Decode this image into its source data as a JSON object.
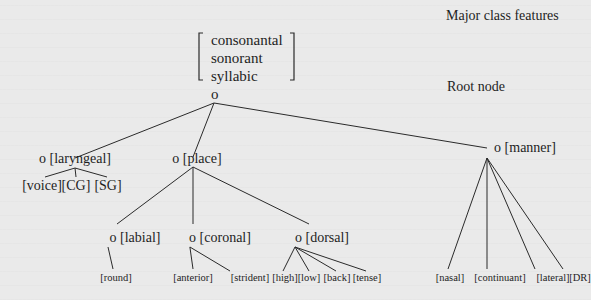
{
  "diagram": {
    "labels": {
      "major_class": "Major class features",
      "root_node": "Root node"
    },
    "major_class_features": [
      "consonantal",
      "sonorant",
      "syllabic"
    ],
    "root": {
      "symbol": "o"
    },
    "nodes": [
      {
        "id": "laryngeal",
        "label": "o [laryngeal]",
        "x": 75,
        "y": 163,
        "attach": [
          75,
          168
        ],
        "children": [
          {
            "label": "[voice]",
            "x": 42,
            "y": 190,
            "attach": [
              45,
              177
            ]
          },
          {
            "label": "[CG]",
            "x": 76,
            "y": 190,
            "attach": [
              76,
              177
            ]
          },
          {
            "label": "[SG]",
            "x": 108,
            "y": 190,
            "attach": [
              107,
              177
            ]
          }
        ]
      },
      {
        "id": "place",
        "label": "o [place]",
        "x": 197,
        "y": 163,
        "attach": [
          193,
          167
        ],
        "children": [
          {
            "id": "labial",
            "label": "o [labial]",
            "x": 135,
            "y": 242,
            "attach": [
              117,
              224
            ],
            "children": [
              {
                "label": "[round]",
                "x": 116,
                "y": 281,
                "attach": [
                  113,
                  269
                ]
              }
            ]
          },
          {
            "id": "coronal",
            "label": "o [coronal]",
            "x": 220,
            "y": 242,
            "attach": [
              193,
              224
            ],
            "children": [
              {
                "label": "[anterior]",
                "x": 193,
                "y": 281,
                "attach": [
                  193,
                  269
                ]
              },
              {
                "label": "[strident]",
                "x": 250,
                "y": 281,
                "attach": [
                  230,
                  271
                ]
              }
            ]
          },
          {
            "id": "dorsal",
            "label": "o [dorsal]",
            "x": 322,
            "y": 242,
            "attach": [
              309,
              224
            ],
            "children": [
              {
                "label": "[high]",
                "x": 285,
                "y": 281,
                "attach": [
                  283,
                  271
                ]
              },
              {
                "label": "[low]",
                "x": 309,
                "y": 281,
                "attach": [
                  309,
                  271
                ]
              },
              {
                "label": "[back]",
                "x": 337,
                "y": 281,
                "attach": [
                  336,
                  271
                ]
              },
              {
                "label": "[tense]",
                "x": 367,
                "y": 281,
                "attach": [
                  366,
                  271
                ]
              }
            ]
          }
        ]
      },
      {
        "id": "manner",
        "label": "o [manner]",
        "x": 525,
        "y": 152,
        "attach": [
          487,
          158
        ],
        "children": [
          {
            "label": "[nasal]",
            "x": 450,
            "y": 281,
            "attach": [
              448,
              269
            ]
          },
          {
            "label": "[continuant]",
            "x": 500,
            "y": 281,
            "attach": [
              487,
              269
            ]
          },
          {
            "label": "[lateral]",
            "x": 553,
            "y": 281,
            "attach": [
              535,
              269
            ]
          },
          {
            "label": "[DR]",
            "x": 580,
            "y": 281,
            "attach": [
              563,
              269
            ]
          }
        ]
      }
    ]
  }
}
